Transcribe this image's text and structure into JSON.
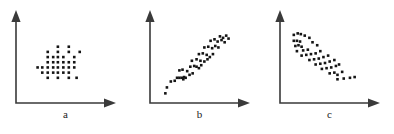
{
  "figure": {
    "background_color": "#ffffff",
    "point_color": "#151515",
    "axis_color": "#3a3a3a",
    "panels": [
      "a",
      "b",
      "c"
    ]
  },
  "labels": {
    "a": "a",
    "b": "b",
    "c": "c"
  },
  "chart_data": [
    {
      "type": "scatter",
      "title": "a",
      "xlabel": "",
      "ylabel": "",
      "xlim": [
        0,
        100
      ],
      "ylim": [
        0,
        100
      ],
      "grid": false,
      "legend": "none",
      "annotation": "no correlation - symmetric cloud of points",
      "marker": "square",
      "points": [
        [
          46,
          72
        ],
        [
          60,
          72
        ],
        [
          33,
          65
        ],
        [
          46,
          65
        ],
        [
          60,
          65
        ],
        [
          74,
          65
        ],
        [
          33,
          58
        ],
        [
          40,
          58
        ],
        [
          46,
          58
        ],
        [
          53,
          58
        ],
        [
          67,
          58
        ],
        [
          33,
          51
        ],
        [
          40,
          51
        ],
        [
          46,
          51
        ],
        [
          53,
          51
        ],
        [
          60,
          51
        ],
        [
          67,
          51
        ],
        [
          20,
          44
        ],
        [
          26,
          44
        ],
        [
          33,
          44
        ],
        [
          40,
          44
        ],
        [
          46,
          44
        ],
        [
          53,
          44
        ],
        [
          60,
          44
        ],
        [
          67,
          44
        ],
        [
          26,
          37
        ],
        [
          33,
          37
        ],
        [
          40,
          37
        ],
        [
          46,
          37
        ],
        [
          53,
          37
        ],
        [
          60,
          37
        ],
        [
          33,
          30
        ],
        [
          46,
          30
        ],
        [
          60,
          30
        ],
        [
          70,
          30
        ]
      ]
    },
    {
      "type": "scatter",
      "title": "b",
      "xlabel": "",
      "ylabel": "",
      "xlim": [
        0,
        100
      ],
      "ylim": [
        0,
        100
      ],
      "grid": false,
      "legend": "none",
      "annotation": "strong positive correlation - points rise left to right",
      "marker": "square",
      "points": [
        [
          12,
          9
        ],
        [
          14,
          17
        ],
        [
          19,
          25
        ],
        [
          24,
          26
        ],
        [
          27,
          30
        ],
        [
          30,
          30
        ],
        [
          33,
          30
        ],
        [
          35,
          28
        ],
        [
          36,
          31
        ],
        [
          38,
          30
        ],
        [
          30,
          40
        ],
        [
          34,
          41
        ],
        [
          40,
          39
        ],
        [
          43,
          34
        ],
        [
          47,
          36
        ],
        [
          44,
          45
        ],
        [
          49,
          46
        ],
        [
          52,
          45
        ],
        [
          55,
          43
        ],
        [
          58,
          47
        ],
        [
          46,
          53
        ],
        [
          52,
          55
        ],
        [
          57,
          53
        ],
        [
          62,
          52
        ],
        [
          66,
          55
        ],
        [
          55,
          62
        ],
        [
          60,
          63
        ],
        [
          65,
          61
        ],
        [
          69,
          58
        ],
        [
          73,
          62
        ],
        [
          62,
          71
        ],
        [
          67,
          72
        ],
        [
          72,
          70
        ],
        [
          76,
          73
        ],
        [
          80,
          71
        ],
        [
          70,
          80
        ],
        [
          75,
          82
        ],
        [
          79,
          79
        ],
        [
          84,
          81
        ],
        [
          88,
          78
        ],
        [
          82,
          86
        ],
        [
          86,
          84
        ],
        [
          90,
          87
        ],
        [
          93,
          83
        ]
      ]
    },
    {
      "type": "scatter",
      "title": "c",
      "xlabel": "",
      "ylabel": "",
      "xlim": [
        0,
        100
      ],
      "ylim": [
        0,
        100
      ],
      "grid": false,
      "legend": "none",
      "annotation": "strong negative correlation - points fall left to right",
      "marker": "square",
      "points": [
        [
          10,
          88
        ],
        [
          15,
          90
        ],
        [
          19,
          89
        ],
        [
          24,
          87
        ],
        [
          10,
          80
        ],
        [
          14,
          80
        ],
        [
          18,
          79
        ],
        [
          30,
          84
        ],
        [
          12,
          73
        ],
        [
          16,
          74
        ],
        [
          20,
          72
        ],
        [
          34,
          78
        ],
        [
          14,
          66
        ],
        [
          22,
          67
        ],
        [
          28,
          68
        ],
        [
          40,
          74
        ],
        [
          20,
          60
        ],
        [
          26,
          61
        ],
        [
          32,
          62
        ],
        [
          38,
          63
        ],
        [
          44,
          66
        ],
        [
          30,
          54
        ],
        [
          36,
          55
        ],
        [
          42,
          56
        ],
        [
          48,
          58
        ],
        [
          54,
          60
        ],
        [
          38,
          48
        ],
        [
          44,
          49
        ],
        [
          50,
          50
        ],
        [
          56,
          52
        ],
        [
          62,
          54
        ],
        [
          46,
          42
        ],
        [
          52,
          43
        ],
        [
          58,
          44
        ],
        [
          64,
          46
        ],
        [
          68,
          48
        ],
        [
          56,
          36
        ],
        [
          62,
          37
        ],
        [
          66,
          34
        ],
        [
          72,
          38
        ],
        [
          66,
          28
        ],
        [
          74,
          29
        ],
        [
          82,
          30
        ],
        [
          88,
          31
        ]
      ]
    }
  ]
}
